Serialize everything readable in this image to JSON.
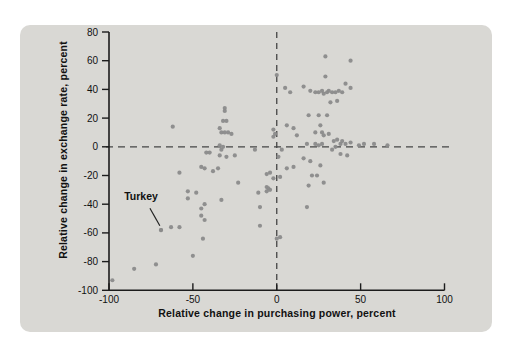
{
  "figure": {
    "page_bg": "#ffffff",
    "panel_bg": "#d9d8d4",
    "dot_color": "#8b8b8b",
    "axis_color": "#1c1c1c",
    "dash_color": "#454545",
    "text_color": "#111111"
  },
  "chart_data": {
    "type": "scatter",
    "title": "",
    "xlabel": "Relative change in purchasing power, percent",
    "ylabel": "Relative change in exchange rate, percent",
    "xlim": [
      -100,
      100
    ],
    "ylim": [
      -100,
      80
    ],
    "x_ticks": [
      -100,
      -50,
      0,
      50,
      100
    ],
    "y_ticks": [
      80,
      60,
      40,
      20,
      0,
      -20,
      -40,
      -60,
      -80,
      -100
    ],
    "grid": false,
    "legend": "none",
    "reference_lines": {
      "vertical_x": 0,
      "horizontal_y": 0,
      "style": "dashed"
    },
    "annotation": {
      "label": "Turkey",
      "label_pos": [
        -82,
        -35
      ],
      "arrow_from": [
        -75.6,
        -42.8
      ],
      "arrow_to": [
        -69.7,
        -55
      ],
      "point": [
        -69,
        -58
      ]
    },
    "points": [
      [
        -62,
        14
      ],
      [
        -31,
        27
      ],
      [
        -31,
        25
      ],
      [
        -32,
        18
      ],
      [
        -30,
        18
      ],
      [
        -34,
        13
      ],
      [
        -33,
        10
      ],
      [
        -31,
        10
      ],
      [
        -29,
        10
      ],
      [
        -27,
        9
      ],
      [
        -34,
        1
      ],
      [
        -32,
        0
      ],
      [
        -33,
        -2
      ],
      [
        -42,
        -4
      ],
      [
        -40,
        -4
      ],
      [
        -34,
        -6
      ],
      [
        -30,
        -7
      ],
      [
        -25,
        -6
      ],
      [
        -13,
        -2
      ],
      [
        -58,
        -18
      ],
      [
        -45,
        -14
      ],
      [
        -43,
        -15
      ],
      [
        -38,
        -17
      ],
      [
        -35,
        -15
      ],
      [
        -23,
        -25
      ],
      [
        -53,
        -31
      ],
      [
        -48,
        -32
      ],
      [
        -53,
        -36
      ],
      [
        -33,
        -37
      ],
      [
        -43,
        -40
      ],
      [
        -45,
        -43
      ],
      [
        -45,
        -48
      ],
      [
        -43,
        -51
      ],
      [
        -44,
        -64
      ],
      [
        -69,
        -58
      ],
      [
        -63,
        -56
      ],
      [
        -58,
        -56
      ],
      [
        -50,
        -76
      ],
      [
        -72,
        -82
      ],
      [
        -85,
        -85
      ],
      [
        -98,
        -93
      ],
      [
        -11,
        -32
      ],
      [
        -10,
        -42
      ],
      [
        -10,
        -55
      ],
      [
        -6,
        -19
      ],
      [
        -4,
        -18
      ],
      [
        -2,
        -22
      ],
      [
        -6,
        -28
      ],
      [
        -5,
        -29
      ],
      [
        -6,
        -31
      ],
      [
        -4,
        -30
      ],
      [
        0,
        50
      ],
      [
        -2,
        12
      ],
      [
        -1,
        9
      ],
      [
        -2,
        7
      ],
      [
        3,
        -2
      ],
      [
        1,
        -7
      ],
      [
        0,
        -64
      ],
      [
        2,
        -63
      ],
      [
        29,
        63
      ],
      [
        44,
        60
      ],
      [
        29,
        49
      ],
      [
        5,
        41
      ],
      [
        8,
        38
      ],
      [
        16,
        42
      ],
      [
        20,
        39
      ],
      [
        23,
        38
      ],
      [
        41,
        44
      ],
      [
        44,
        41
      ],
      [
        25,
        38
      ],
      [
        27,
        39
      ],
      [
        28,
        37
      ],
      [
        30,
        38
      ],
      [
        31,
        39
      ],
      [
        33,
        38
      ],
      [
        35,
        38
      ],
      [
        37,
        39
      ],
      [
        39,
        38
      ],
      [
        32,
        31
      ],
      [
        36,
        32
      ],
      [
        19,
        22
      ],
      [
        25,
        22
      ],
      [
        30,
        22
      ],
      [
        26,
        15
      ],
      [
        6,
        15
      ],
      [
        10,
        13
      ],
      [
        12,
        8
      ],
      [
        23,
        10
      ],
      [
        27,
        10
      ],
      [
        28,
        8
      ],
      [
        31,
        9
      ],
      [
        18,
        2
      ],
      [
        23,
        2
      ],
      [
        25,
        1
      ],
      [
        27,
        2
      ],
      [
        34,
        4
      ],
      [
        36,
        5
      ],
      [
        38,
        2
      ],
      [
        39,
        4
      ],
      [
        41,
        2
      ],
      [
        44,
        3
      ],
      [
        35,
        0
      ],
      [
        33,
        -2
      ],
      [
        38,
        -5
      ],
      [
        42,
        -6
      ],
      [
        49,
        1
      ],
      [
        52,
        2
      ],
      [
        58,
        2
      ],
      [
        66,
        1
      ],
      [
        16,
        -8
      ],
      [
        20,
        -10
      ],
      [
        26,
        -13
      ],
      [
        10,
        -14
      ],
      [
        6,
        -15
      ],
      [
        21,
        -20
      ],
      [
        24,
        -20
      ],
      [
        2,
        -21
      ],
      [
        19,
        -27
      ],
      [
        28,
        -25
      ],
      [
        18,
        -42
      ]
    ]
  }
}
